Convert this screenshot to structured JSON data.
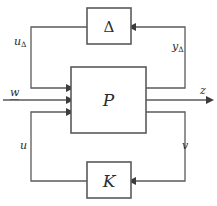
{
  "figure": {
    "type": "block-diagram",
    "background_color": "#ffffff",
    "line_color": "#5a5a5a",
    "text_color": "#2b2b2b",
    "width": 217,
    "height": 206
  },
  "blocks": [
    {
      "id": "delta",
      "label": "Δ",
      "x": 87,
      "y": 8,
      "width": 44,
      "height": 36
    },
    {
      "id": "plant",
      "label": "P",
      "x": 71,
      "y": 67,
      "width": 75,
      "height": 66
    },
    {
      "id": "controller",
      "label": "K",
      "x": 87,
      "y": 162,
      "width": 44,
      "height": 36
    }
  ],
  "signals": [
    {
      "id": "u-delta",
      "label": "u",
      "subscript": "Δ",
      "underlined": false,
      "x": 14,
      "y": 36
    },
    {
      "id": "y-delta",
      "label": "y",
      "subscript": "Δ",
      "underlined": false,
      "x": 172,
      "y": 41
    },
    {
      "id": "w",
      "label": "w",
      "subscript": "",
      "underlined": true,
      "x": 10,
      "y": 87
    },
    {
      "id": "z",
      "label": "z",
      "subscript": "",
      "underlined": false,
      "x": 200,
      "y": 85
    },
    {
      "id": "u",
      "label": "u",
      "subscript": "",
      "underlined": false,
      "x": 20,
      "y": 140
    },
    {
      "id": "v",
      "label": "v",
      "subscript": "",
      "underlined": false,
      "x": 182,
      "y": 140
    }
  ],
  "connections": [
    {
      "id": "delta-out-to-plant-in1",
      "from": "delta",
      "to": "plant",
      "path": "M 87 27 L 31 27 L 31 88 L 68 88",
      "arrow": "end"
    },
    {
      "id": "plant-out1-to-delta-in",
      "from": "plant",
      "to": "delta",
      "path": "M 146 88 L 185 88 L 185 27 L 134 27",
      "arrow": "end"
    },
    {
      "id": "w-into-plant",
      "from": "w",
      "to": "plant",
      "path": "M 4 100 L 68 100",
      "arrow": "end"
    },
    {
      "id": "plant-out-to-z",
      "from": "plant",
      "to": "z",
      "path": "M 146 100 L 210 100",
      "arrow": "end"
    },
    {
      "id": "controller-out-to-plant-in3",
      "from": "controller",
      "to": "plant",
      "path": "M 87 181 L 31 181 L 31 112 L 68 112",
      "arrow": "end"
    },
    {
      "id": "plant-out3-to-controller-in",
      "from": "plant",
      "to": "controller",
      "path": "M 146 112 L 185 112 L 185 181 L 134 181",
      "arrow": "end"
    }
  ]
}
